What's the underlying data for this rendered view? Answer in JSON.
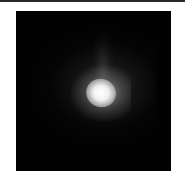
{
  "image": {
    "description": "Grayscale astronomical-style image: bright diffuse blob centered on a black background",
    "background_color": "#020202",
    "core_color": "#ffffff"
  }
}
